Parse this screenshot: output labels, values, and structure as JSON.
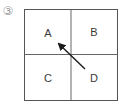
{
  "figure": {
    "number_label": "③",
    "cells": [
      {
        "id": "A",
        "label": "A",
        "position": "top-left"
      },
      {
        "id": "B",
        "label": "B",
        "position": "top-right"
      },
      {
        "id": "C",
        "label": "C",
        "position": "bottom-left"
      },
      {
        "id": "D",
        "label": "D",
        "position": "bottom-right"
      }
    ],
    "arrow": {
      "from": "D",
      "to": "A",
      "direction": "diagonal-up-left"
    },
    "colors": {
      "border": "#555555",
      "divider": "#666666",
      "arrow": "#1a1a1a",
      "text": "#3a3a3a",
      "number_label": "#9a9a9a"
    }
  }
}
